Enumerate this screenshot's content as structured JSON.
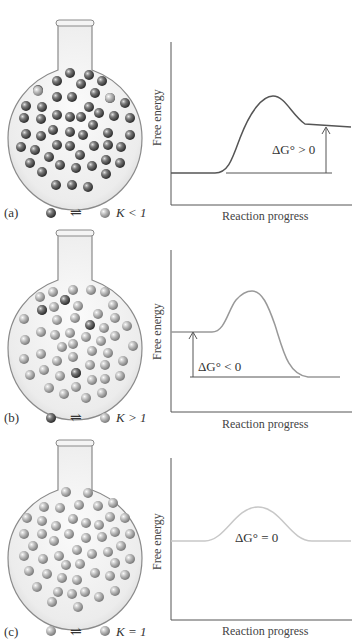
{
  "panels": [
    {
      "id": "a",
      "panel_label": "(a)",
      "k_relation": "K < 1",
      "delta_g_label": "ΔG° > 0",
      "molecule_shade": "dark",
      "curve_color": "#555555",
      "y_axis_label": "Free energy",
      "x_axis_label": "Reaction progress"
    },
    {
      "id": "b",
      "panel_label": "(b)",
      "k_relation": "K > 1",
      "delta_g_label": "ΔG° < 0",
      "molecule_shade": "mixed",
      "curve_color": "#999999",
      "y_axis_label": "Free energy",
      "x_axis_label": "Reaction progress"
    },
    {
      "id": "c",
      "panel_label": "(c)",
      "k_relation": "K = 1",
      "delta_g_label": "ΔG° = 0",
      "molecule_shade": "light",
      "curve_color": "#c8c8c8",
      "y_axis_label": "Free energy",
      "x_axis_label": "Reaction progress"
    }
  ],
  "equilibrium_symbol": "⇌",
  "colors": {
    "dark_molecule": "#4a4a4a",
    "light_molecule": "#9a9a9a",
    "axis": "#555555",
    "flask_outline": "#8a8a8a",
    "flask_fill": "#f2f2f2"
  }
}
